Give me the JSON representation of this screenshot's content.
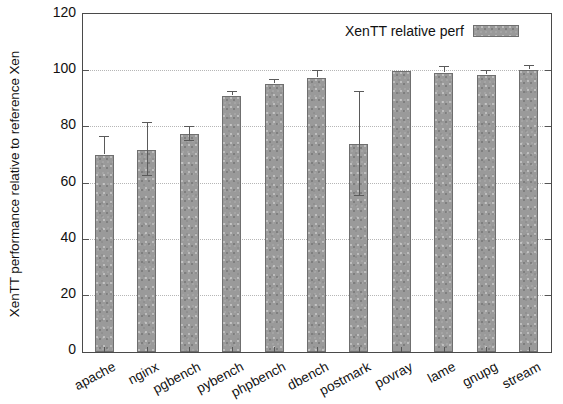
{
  "chart_data": {
    "type": "bar",
    "title": "",
    "xlabel": "",
    "ylabel": "XenTT performance relative to reference Xen",
    "ylim": [
      0,
      120
    ],
    "ytick_values": [
      0,
      20,
      40,
      60,
      80,
      100,
      120
    ],
    "ytick_labels": [
      "0",
      "20",
      "40",
      "60",
      "80",
      "100",
      "120"
    ],
    "grid": true,
    "legend": {
      "position": "top-right",
      "entries": [
        {
          "name": "XenTT relative perf",
          "color": "#9a9a9a",
          "pattern": "speckled-gray"
        }
      ]
    },
    "categories": [
      "apache",
      "nginx",
      "pgbench",
      "pybench",
      "phpbench",
      "dbench",
      "postmark",
      "povray",
      "lame",
      "gnupg",
      "stream"
    ],
    "series": [
      {
        "name": "XenTT relative perf",
        "values": [
          70,
          72,
          77.5,
          91,
          95.5,
          97.5,
          74,
          100,
          99.5,
          98.5,
          100.5
        ],
        "errors_upper": [
          6.5,
          9.5,
          2.5,
          1.5,
          1.5,
          2.5,
          18.5,
          0,
          2.0,
          1.5,
          1.5
        ],
        "errors_lower": [
          0,
          9.5,
          2.5,
          0,
          0,
          0,
          18.5,
          0,
          0,
          0,
          0
        ]
      }
    ]
  },
  "legend_label": "XenTT relative perf"
}
